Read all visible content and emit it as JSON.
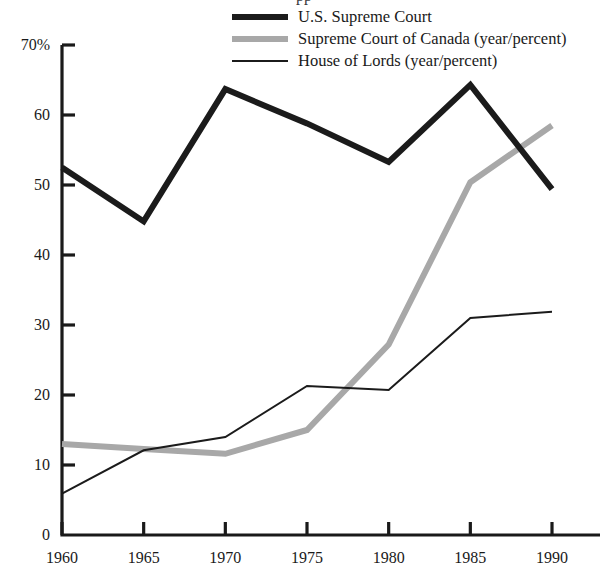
{
  "chart_data": {
    "type": "line",
    "title": "",
    "xlabel": "",
    "ylabel": "",
    "categories": [
      1960,
      1965,
      1970,
      1975,
      1980,
      1985,
      1990
    ],
    "x": [
      1960,
      1965,
      1970,
      1975,
      1980,
      1985,
      1990
    ],
    "xlim": [
      1960,
      1990
    ],
    "ylim": [
      0,
      70
    ],
    "grid": false,
    "legend_position": "top-right",
    "y_ticks": [
      "0",
      "10",
      "20",
      "30",
      "40",
      "50",
      "60",
      "70%"
    ],
    "y_tick_values": [
      0,
      10,
      20,
      30,
      40,
      50,
      60,
      70
    ],
    "x_ticks": [
      "1960",
      "1965",
      "1970",
      "1975",
      "1980",
      "1985",
      "1990"
    ],
    "series": [
      {
        "name": "U.S. Supreme Court",
        "color": "#1b1b1b",
        "width": 6,
        "values": [
          52.5,
          44.8,
          63.7,
          58.8,
          53.3,
          64.3,
          49.4
        ]
      },
      {
        "name": "Supreme Court of Canada (year/percent)",
        "color": "#a8a8a8",
        "width": 6,
        "values": [
          13.0,
          12.3,
          11.6,
          15.0,
          27.2,
          50.4,
          58.5
        ]
      },
      {
        "name": "House of Lords (year/percent)",
        "color": "#1b1b1b",
        "width": 2,
        "values": [
          5.9,
          12.1,
          14.0,
          21.3,
          20.7,
          31.0,
          31.9
        ]
      }
    ]
  },
  "legend": {
    "items": [
      {
        "label": "U.S. Supreme Court",
        "swatch": "thick-black-line-icon"
      },
      {
        "label": "Supreme Court of Canada (year/percent)",
        "swatch": "thick-gray-line-icon"
      },
      {
        "label": "House of Lords (year/percent)",
        "swatch": "thin-black-line-icon"
      }
    ]
  },
  "cropped_title_fragment": "pp"
}
